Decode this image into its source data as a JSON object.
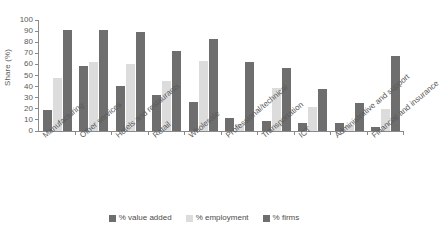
{
  "chart_data": {
    "type": "bar",
    "title": "",
    "subtitle": "",
    "xlabel": "",
    "ylabel": "Share (%)",
    "ylim": [
      0,
      100
    ],
    "yticks": [
      0,
      10,
      20,
      30,
      40,
      50,
      60,
      70,
      80,
      90,
      100
    ],
    "grid": false,
    "legend_position": "bottom",
    "categories": [
      "Manufacturing",
      "Other services",
      "Hotels and restaurants",
      "Retail",
      "Wholesale",
      "Professional/technical",
      "Transportation",
      "ICT",
      "Administrative and support",
      "Financial and insurance"
    ],
    "series": [
      {
        "name": "% value added",
        "color": "#6e6e6e",
        "values": [
          19,
          59,
          41,
          32,
          26,
          12,
          9,
          7,
          7,
          4
        ]
      },
      {
        "name": "% employment",
        "color": "#dcdcdc",
        "values": [
          48,
          62,
          60,
          45,
          63,
          6,
          39,
          22,
          5,
          20
        ]
      },
      {
        "name": "% firms",
        "color": "#6e6e6e",
        "values": [
          91,
          91,
          89,
          72,
          83,
          62,
          57,
          38,
          25,
          68
        ]
      }
    ]
  }
}
